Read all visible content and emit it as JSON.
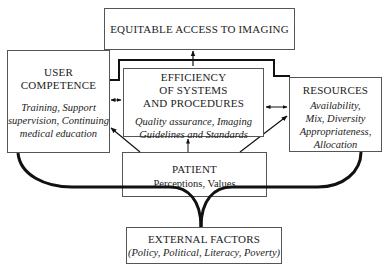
{
  "diagram": {
    "nodes": {
      "access": {
        "title": "EQUITABLE ACCESS TO IMAGING"
      },
      "user": {
        "title": "USER\nCOMPETENCE",
        "details": "Training, Support\nsupervision, Continuing\nmedical education"
      },
      "efficiency": {
        "title": "EFFICIENCY\nOF SYSTEMS\nAND PROCEDURES",
        "details": "Quality assurance, Imaging\nGuidelines and Standards"
      },
      "resources": {
        "title": "RESOURCES",
        "details": "Availability,\nMix, Diversity\nAppropriateness,\nAllocation"
      },
      "patient": {
        "title": "PATIENT",
        "details": "Perceptions, Values"
      },
      "external": {
        "title": "EXTERNAL FACTORS",
        "details_open": "(",
        "details": "(Policy, Political, Literacy, Poverty)"
      }
    },
    "edges": [
      {
        "from": "efficiency",
        "to": "access",
        "type": "arrow"
      },
      {
        "from": "user",
        "to": "access",
        "type": "thick-bracket"
      },
      {
        "from": "resources",
        "to": "access",
        "type": "thick-bracket"
      },
      {
        "from": "user",
        "to": "efficiency",
        "type": "double-arrow"
      },
      {
        "from": "efficiency",
        "to": "resources",
        "type": "double-arrow"
      },
      {
        "from": "patient",
        "to": "efficiency",
        "type": "arrow"
      },
      {
        "from": "patient",
        "to": "user",
        "type": "arrow"
      },
      {
        "from": "patient",
        "to": "resources",
        "type": "arrow"
      },
      {
        "from": "external",
        "to": "user",
        "type": "thick-curve"
      },
      {
        "from": "external",
        "to": "resources",
        "type": "thick-curve"
      }
    ],
    "colors": {
      "line": "#111111",
      "box_border": "#555555",
      "text": "#222222"
    }
  }
}
